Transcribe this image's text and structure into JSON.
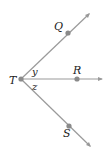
{
  "diagram": {
    "type": "rays from point",
    "vertex": {
      "label": "T",
      "x": 21,
      "y": 79
    },
    "rays": [
      {
        "name": "TQ",
        "point_label": "Q",
        "dot": [
          68,
          33
        ],
        "end": [
          89,
          13
        ]
      },
      {
        "name": "TR",
        "point_label": "R",
        "dot": [
          77,
          79
        ],
        "end": [
          102,
          79
        ]
      },
      {
        "name": "TS",
        "point_label": "S",
        "dot": [
          69,
          126
        ],
        "end": [
          90,
          146
        ]
      }
    ],
    "angles": [
      {
        "label": "y",
        "between": "TQ-TR"
      },
      {
        "label": "z",
        "between": "TR-TS"
      }
    ],
    "colors": {
      "line": "#999999",
      "dot": "#888888",
      "text": "#222222"
    }
  }
}
